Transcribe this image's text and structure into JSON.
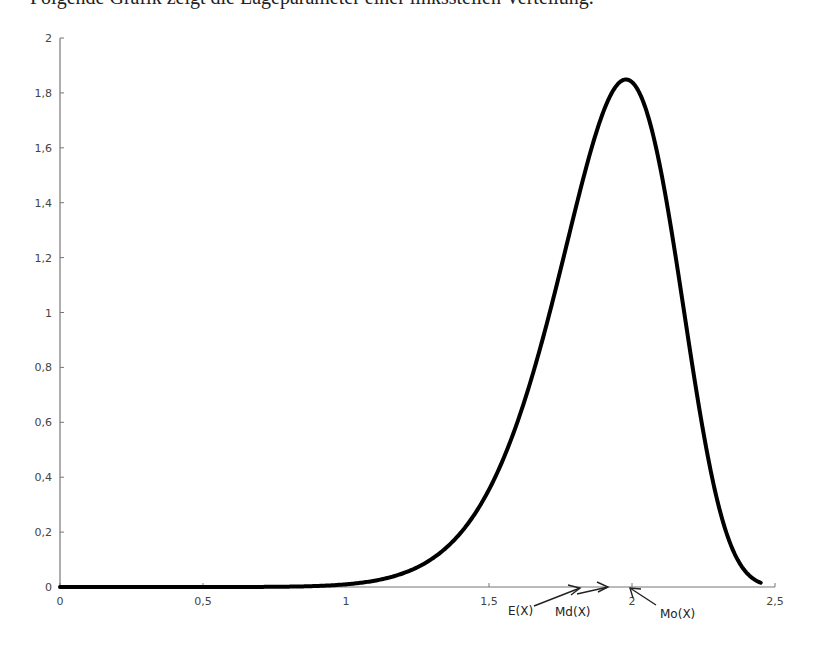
{
  "header": {
    "clipped_text": "Folgende Grafik zeigt die Lageparameter einer linkssteilen Verteilung."
  },
  "chart_data": {
    "type": "line",
    "title": "",
    "xlabel": "",
    "ylabel": "",
    "xlim": [
      0,
      2.5
    ],
    "ylim": [
      0,
      2
    ],
    "grid": false,
    "legend": null,
    "x_ticks": [
      "0",
      "0,5",
      "1",
      "1,5",
      "2",
      "2,5"
    ],
    "x_tick_values": [
      0,
      0.5,
      1,
      1.5,
      2,
      2.5
    ],
    "y_ticks": [
      "0",
      "0,2",
      "0,4",
      "0,6",
      "0,8",
      "1",
      "1,2",
      "1,4",
      "1,6",
      "1,8",
      "2"
    ],
    "y_tick_values": [
      0,
      0.2,
      0.4,
      0.6,
      0.8,
      1,
      1.2,
      1.4,
      1.6,
      1.8,
      2
    ],
    "series": [
      {
        "name": "density",
        "x": [
          0,
          0.25,
          0.5,
          0.75,
          1.0,
          1.1,
          1.2,
          1.3,
          1.4,
          1.5,
          1.6,
          1.7,
          1.8,
          1.85,
          1.9,
          1.95,
          1.98,
          2.0,
          2.05,
          2.1,
          2.15,
          2.2,
          2.25,
          2.3,
          2.35,
          2.4,
          2.45
        ],
        "y": [
          0,
          0,
          0,
          0.0003,
          0.0098,
          0.0299,
          0.0789,
          0.1844,
          0.3843,
          0.7118,
          1.1497,
          1.5739,
          1.8142,
          1.8369,
          1.7938,
          1.6699,
          1.56,
          1.8394,
          1.3926,
          1.0834,
          0.7702,
          0.4931,
          0.2798,
          0.1377,
          0.0578,
          0.02,
          0.0056
        ]
      }
    ],
    "annotations": [
      {
        "label": "E(X)",
        "x": 1.9,
        "arrow": true
      },
      {
        "label": "Md(X)",
        "x": 1.93,
        "arrow": true
      },
      {
        "label": "Mo(X)",
        "x": 1.98,
        "arrow": true
      }
    ],
    "distribution_model": {
      "family": "Weibull",
      "shape": 10,
      "scale": 2.0,
      "peak_y": 1.84,
      "peak_x": 1.98
    }
  }
}
